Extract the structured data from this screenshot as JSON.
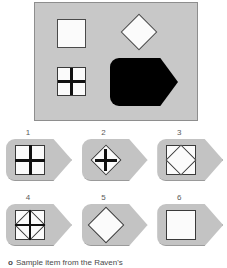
{
  "figure": {
    "type": "matrix-reasoning-item",
    "caption_marker": "o",
    "caption_text": "Sample item from the Raven's"
  },
  "colors": {
    "panel_fill": "#c8c8c8",
    "panel_border": "#8e8e8e",
    "tile_fill": "#c3c3c3",
    "shape_white": "#fbfbfb",
    "shape_outline": "#3a3a3a",
    "shape_black": "#000000",
    "number_text": "#5a5a5a",
    "caption_text": "#4a4a4a"
  },
  "stimulus": {
    "name": "stimulus-panel",
    "shape": "rectangle",
    "elements": [
      {
        "id": "square-plain",
        "label": "plain white square",
        "form": "square",
        "fill": "white",
        "overlay": "none",
        "position": "top-left",
        "x": 22,
        "y": 16,
        "width": 29,
        "height": 29
      },
      {
        "id": "diamond-plain",
        "label": "plain white diamond",
        "form": "diamond",
        "fill": "white",
        "overlay": "none",
        "position": "top-right",
        "x": 91,
        "y": 16,
        "width": 26,
        "height": 26
      },
      {
        "id": "square-quartered",
        "label": "white square quartered by black cross",
        "form": "square",
        "fill": "white",
        "overlay": "cross",
        "position": "bottom-left",
        "x": 22,
        "y": 64,
        "width": 29,
        "height": 29
      },
      {
        "id": "tag-black",
        "label": "large solid black tag shape",
        "form": "tag",
        "fill": "black",
        "overlay": "none",
        "position": "bottom-right",
        "x": 75,
        "y": 55,
        "width": 68,
        "height": 48
      }
    ]
  },
  "options": {
    "name": "answer-options",
    "count": 6,
    "rows": [
      [
        {
          "number": "1",
          "form": "square",
          "overlay": "thick-cross",
          "description": "white square quartered by a thick black cross"
        },
        {
          "number": "2",
          "form": "diamond",
          "overlay": "thick-cross",
          "description": "white diamond crossed by a thick black cross"
        },
        {
          "number": "3",
          "form": "square-with-diamond",
          "overlay": "none",
          "description": "white square containing an inscribed diamond"
        }
      ],
      [
        {
          "number": "4",
          "form": "square-with-diamond",
          "overlay": "cross-and-diagonals",
          "description": "white square with inscribed diamond plus cross"
        },
        {
          "number": "5",
          "form": "diamond",
          "overlay": "none",
          "description": "plain white diamond"
        },
        {
          "number": "6",
          "form": "square",
          "overlay": "none",
          "description": "plain white square"
        }
      ]
    ]
  }
}
